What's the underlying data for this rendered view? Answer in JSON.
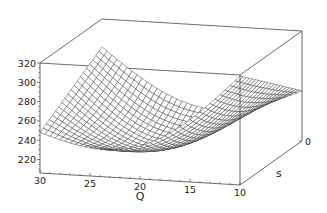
{
  "chart_data": {
    "type": "surface3d",
    "title": "",
    "xlabel": "Q",
    "ylabel": "s",
    "zlabel": "",
    "x_ticks": [
      "30",
      "25",
      "20",
      "15",
      "10"
    ],
    "x_tick_values": [
      30,
      25,
      20,
      15,
      10
    ],
    "y_ticks": [
      "0"
    ],
    "y_tick_values": [
      0
    ],
    "z_ticks": [
      "220",
      "240",
      "260",
      "280",
      "300",
      "320"
    ],
    "z_tick_values": [
      220,
      240,
      260,
      280,
      300,
      320
    ],
    "xlim": [
      10,
      30
    ],
    "ylim": [
      0,
      1
    ],
    "zlim": [
      206,
      320
    ],
    "grid": false,
    "surface": {
      "style": "wireframe-hidden",
      "Q_samples": 40,
      "s_samples": 20,
      "corner_values": {
        "Q30_s0": 291,
        "Q30_s1": 248,
        "Q10_s0": 258,
        "Q10_s1": 319
      },
      "minimum": {
        "Q": 19,
        "s": 0.75,
        "z": 214
      }
    },
    "line_color": "#333333",
    "box_color": "#444444"
  }
}
